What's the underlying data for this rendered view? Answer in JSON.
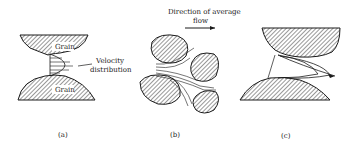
{
  "figure": {
    "panels": [
      {
        "id": "a",
        "caption": "(a)",
        "labels": {
          "top_grain": "Grain",
          "bottom_grain": "Grain",
          "velocity_line1": "Velocity",
          "velocity_line2": "distribution"
        }
      },
      {
        "id": "b",
        "caption": "(b)",
        "labels": {
          "flow_line1": "Direction of average",
          "flow_line2": "flow"
        }
      },
      {
        "id": "c",
        "caption": "(c)"
      }
    ],
    "colors": {
      "ink": "#1a1a1a",
      "background": "#ffffff"
    }
  }
}
